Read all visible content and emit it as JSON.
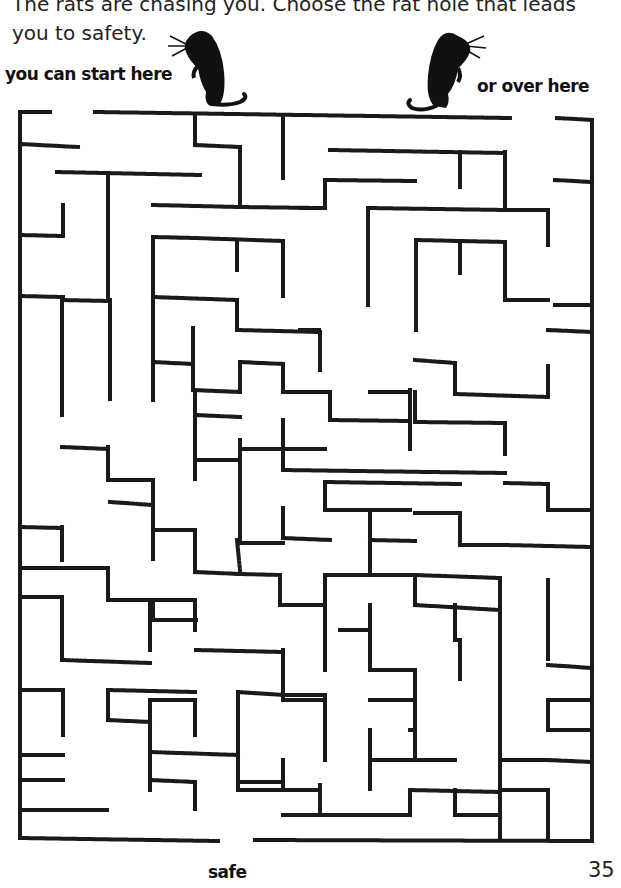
{
  "instructions": {
    "line1": "The rats are chasing you. Choose the rat hole that leads",
    "line2": "you to safety."
  },
  "labels": {
    "start_left": "you can start here",
    "start_right": "or over here",
    "exit": "safe"
  },
  "page_number": "35",
  "icons": {
    "rat_left": "rat-silhouette-icon",
    "rat_right": "rat-silhouette-icon"
  },
  "colors": {
    "wall": "#1a1a1a",
    "background": "#ffffff"
  },
  "maze": {
    "walls": [
      [
        20,
        112,
        50,
        112
      ],
      [
        95,
        112,
        510,
        118
      ],
      [
        557,
        118,
        592,
        120
      ],
      [
        20,
        112,
        20,
        838
      ],
      [
        592,
        120,
        592,
        838
      ],
      [
        20,
        838,
        218,
        841
      ],
      [
        255,
        840,
        592,
        841
      ],
      [
        20,
        144,
        78,
        147
      ],
      [
        195,
        115,
        195,
        145
      ],
      [
        195,
        145,
        240,
        147
      ],
      [
        240,
        147,
        240,
        205
      ],
      [
        283,
        116,
        283,
        178
      ],
      [
        57,
        172,
        200,
        175
      ],
      [
        108,
        174,
        108,
        300
      ],
      [
        153,
        205,
        240,
        207
      ],
      [
        240,
        207,
        320,
        208
      ],
      [
        330,
        150,
        505,
        153
      ],
      [
        460,
        152,
        460,
        188
      ],
      [
        505,
        152,
        505,
        210
      ],
      [
        505,
        210,
        548,
        210
      ],
      [
        325,
        180,
        415,
        181
      ],
      [
        325,
        180,
        325,
        208
      ],
      [
        300,
        208,
        325,
        208
      ],
      [
        368,
        208,
        505,
        210
      ],
      [
        368,
        208,
        368,
        305
      ],
      [
        548,
        210,
        548,
        245
      ],
      [
        555,
        180,
        592,
        182
      ],
      [
        20,
        235,
        63,
        236
      ],
      [
        20,
        296,
        63,
        297
      ],
      [
        63,
        205,
        63,
        235
      ],
      [
        153,
        237,
        196,
        238
      ],
      [
        153,
        237,
        153,
        400
      ],
      [
        195,
        238,
        283,
        241
      ],
      [
        283,
        241,
        283,
        297
      ],
      [
        237,
        241,
        237,
        270
      ],
      [
        62,
        300,
        108,
        301
      ],
      [
        62,
        300,
        62,
        415
      ],
      [
        110,
        300,
        110,
        400
      ],
      [
        153,
        398,
        153,
        397
      ],
      [
        153,
        297,
        237,
        300
      ],
      [
        237,
        300,
        237,
        330
      ],
      [
        237,
        330,
        320,
        332
      ],
      [
        320,
        332,
        320,
        370
      ],
      [
        416,
        240,
        505,
        242
      ],
      [
        416,
        240,
        416,
        330
      ],
      [
        460,
        242,
        460,
        274
      ],
      [
        505,
        242,
        505,
        300
      ],
      [
        505,
        300,
        548,
        300
      ],
      [
        548,
        330,
        592,
        332
      ],
      [
        555,
        305,
        592,
        305
      ],
      [
        193,
        328,
        193,
        362
      ],
      [
        153,
        362,
        193,
        364
      ],
      [
        193,
        362,
        193,
        390
      ],
      [
        193,
        390,
        240,
        392
      ],
      [
        240,
        362,
        240,
        392
      ],
      [
        240,
        362,
        283,
        364
      ],
      [
        283,
        364,
        283,
        392
      ],
      [
        283,
        392,
        330,
        392
      ],
      [
        330,
        392,
        330,
        420
      ],
      [
        330,
        420,
        410,
        421
      ],
      [
        410,
        390,
        410,
        450
      ],
      [
        370,
        392,
        410,
        392
      ],
      [
        300,
        330,
        320,
        330
      ],
      [
        415,
        360,
        455,
        363
      ],
      [
        455,
        363,
        455,
        394
      ],
      [
        455,
        394,
        548,
        397
      ],
      [
        548,
        366,
        548,
        397
      ],
      [
        415,
        392,
        415,
        422
      ],
      [
        415,
        422,
        505,
        423
      ],
      [
        505,
        423,
        505,
        455
      ],
      [
        62,
        447,
        108,
        449
      ],
      [
        108,
        447,
        108,
        480
      ],
      [
        108,
        480,
        153,
        480
      ],
      [
        153,
        480,
        153,
        560
      ],
      [
        195,
        392,
        195,
        480
      ],
      [
        195,
        415,
        240,
        417
      ],
      [
        240,
        449,
        283,
        449
      ],
      [
        283,
        420,
        283,
        470
      ],
      [
        283,
        470,
        505,
        473
      ],
      [
        283,
        449,
        325,
        449
      ],
      [
        196,
        460,
        240,
        460
      ],
      [
        240,
        440,
        240,
        480
      ],
      [
        325,
        482,
        460,
        484
      ],
      [
        325,
        482,
        325,
        510
      ],
      [
        325,
        510,
        410,
        510
      ],
      [
        505,
        483,
        548,
        484
      ],
      [
        548,
        484,
        548,
        510
      ],
      [
        548,
        510,
        592,
        510
      ],
      [
        20,
        527,
        62,
        528
      ],
      [
        62,
        527,
        62,
        560
      ],
      [
        110,
        502,
        153,
        505
      ],
      [
        153,
        505,
        153,
        530
      ],
      [
        153,
        530,
        195,
        530
      ],
      [
        195,
        530,
        195,
        570
      ],
      [
        240,
        482,
        240,
        540
      ],
      [
        283,
        508,
        283,
        538
      ],
      [
        283,
        538,
        330,
        540
      ],
      [
        240,
        543,
        283,
        543
      ],
      [
        237,
        540,
        240,
        570
      ],
      [
        370,
        513,
        370,
        540
      ],
      [
        370,
        540,
        415,
        541
      ],
      [
        415,
        513,
        460,
        513
      ],
      [
        460,
        513,
        460,
        545
      ],
      [
        460,
        545,
        505,
        545
      ],
      [
        505,
        545,
        592,
        547
      ],
      [
        370,
        543,
        370,
        575
      ],
      [
        20,
        568,
        108,
        568
      ],
      [
        108,
        568,
        108,
        600
      ],
      [
        108,
        600,
        153,
        600
      ],
      [
        153,
        600,
        153,
        620
      ],
      [
        62,
        600,
        62,
        650
      ],
      [
        195,
        572,
        240,
        574
      ],
      [
        240,
        574,
        280,
        575
      ],
      [
        280,
        575,
        280,
        605
      ],
      [
        280,
        605,
        325,
        605
      ],
      [
        325,
        575,
        325,
        670
      ],
      [
        325,
        575,
        415,
        575
      ],
      [
        415,
        575,
        415,
        605
      ],
      [
        415,
        605,
        500,
        610
      ],
      [
        415,
        575,
        500,
        578
      ],
      [
        500,
        578,
        500,
        800
      ],
      [
        548,
        580,
        548,
        660
      ],
      [
        548,
        665,
        592,
        668
      ],
      [
        20,
        597,
        62,
        597
      ],
      [
        62,
        597,
        62,
        630
      ],
      [
        150,
        600,
        150,
        650
      ],
      [
        150,
        600,
        195,
        600
      ],
      [
        195,
        600,
        195,
        630
      ],
      [
        62,
        660,
        150,
        663
      ],
      [
        150,
        620,
        196,
        620
      ],
      [
        62,
        620,
        62,
        660
      ],
      [
        196,
        650,
        283,
        652
      ],
      [
        283,
        650,
        283,
        700
      ],
      [
        283,
        700,
        325,
        700
      ],
      [
        340,
        630,
        370,
        630
      ],
      [
        370,
        605,
        370,
        670
      ],
      [
        370,
        670,
        415,
        670
      ],
      [
        415,
        670,
        415,
        760
      ],
      [
        455,
        605,
        455,
        640
      ],
      [
        455,
        640,
        460,
        640
      ],
      [
        460,
        640,
        460,
        680
      ],
      [
        20,
        690,
        63,
        690
      ],
      [
        63,
        690,
        63,
        735
      ],
      [
        108,
        690,
        195,
        692
      ],
      [
        108,
        690,
        108,
        720
      ],
      [
        150,
        700,
        150,
        790
      ],
      [
        150,
        700,
        195,
        700
      ],
      [
        195,
        700,
        195,
        735
      ],
      [
        238,
        692,
        238,
        760
      ],
      [
        238,
        692,
        283,
        695
      ],
      [
        283,
        695,
        325,
        695
      ],
      [
        325,
        695,
        325,
        760
      ],
      [
        370,
        700,
        415,
        700
      ],
      [
        410,
        730,
        415,
        730
      ],
      [
        370,
        730,
        370,
        790
      ],
      [
        370,
        760,
        455,
        760
      ],
      [
        20,
        755,
        63,
        755
      ],
      [
        20,
        780,
        63,
        780
      ],
      [
        20,
        810,
        108,
        810
      ],
      [
        108,
        720,
        150,
        722
      ],
      [
        150,
        752,
        238,
        755
      ],
      [
        150,
        780,
        195,
        782
      ],
      [
        195,
        782,
        195,
        810
      ],
      [
        238,
        755,
        238,
        790
      ],
      [
        238,
        790,
        320,
        790
      ],
      [
        320,
        785,
        320,
        815
      ],
      [
        238,
        782,
        280,
        782
      ],
      [
        283,
        760,
        283,
        790
      ],
      [
        283,
        815,
        410,
        815
      ],
      [
        410,
        790,
        410,
        815
      ],
      [
        410,
        760,
        455,
        760
      ],
      [
        455,
        790,
        455,
        815
      ],
      [
        455,
        815,
        500,
        815
      ],
      [
        500,
        790,
        548,
        790
      ],
      [
        548,
        760,
        592,
        762
      ],
      [
        548,
        700,
        592,
        700
      ],
      [
        548,
        700,
        548,
        730
      ],
      [
        548,
        730,
        592,
        730
      ],
      [
        500,
        760,
        548,
        760
      ],
      [
        410,
        790,
        500,
        792
      ],
      [
        500,
        792,
        500,
        838
      ],
      [
        548,
        790,
        548,
        838
      ]
    ]
  }
}
